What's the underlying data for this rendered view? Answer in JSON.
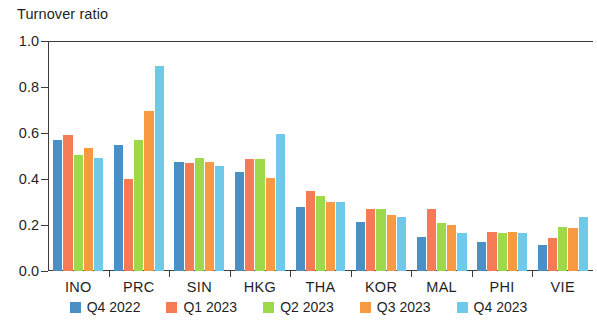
{
  "chart_data": {
    "type": "bar",
    "title": "Turnover ratio",
    "xlabel": "",
    "ylabel": "",
    "ylim": [
      0.0,
      1.0
    ],
    "ytick_labels": [
      "0.0",
      "0.2",
      "0.4",
      "0.6",
      "0.8",
      "1.0"
    ],
    "ytick_values": [
      0.0,
      0.2,
      0.4,
      0.6,
      0.8,
      1.0
    ],
    "grid": false,
    "legend_position": "bottom",
    "categories": [
      "INO",
      "PRC",
      "SIN",
      "HKG",
      "THA",
      "KOR",
      "MAL",
      "PHI",
      "VIE"
    ],
    "series": [
      {
        "name": "Q4 2022",
        "color": "#4a90c4",
        "values": [
          0.57,
          0.55,
          0.475,
          0.43,
          0.28,
          0.215,
          0.15,
          0.125,
          0.115
        ]
      },
      {
        "name": "Q1 2023",
        "color": "#f47b56",
        "values": [
          0.59,
          0.4,
          0.47,
          0.485,
          0.35,
          0.27,
          0.27,
          0.17,
          0.145
        ]
      },
      {
        "name": "Q2 2023",
        "color": "#9ed84b",
        "values": [
          0.505,
          0.57,
          0.49,
          0.485,
          0.325,
          0.27,
          0.21,
          0.165,
          0.19
        ]
      },
      {
        "name": "Q3 2023",
        "color": "#f89a41",
        "values": [
          0.535,
          0.695,
          0.475,
          0.405,
          0.3,
          0.245,
          0.2,
          0.17,
          0.185
        ]
      },
      {
        "name": "Q4 2023",
        "color": "#6fc9e8",
        "values": [
          0.49,
          0.89,
          0.455,
          0.595,
          0.3,
          0.235,
          0.165,
          0.165,
          0.235
        ]
      }
    ]
  },
  "legend": {
    "items": [
      {
        "label": "Q4 2022",
        "color": "#4a90c4"
      },
      {
        "label": "Q1 2023",
        "color": "#f47b56"
      },
      {
        "label": "Q2 2023",
        "color": "#9ed84b"
      },
      {
        "label": "Q3 2023",
        "color": "#f89a41"
      },
      {
        "label": "Q4 2023",
        "color": "#6fc9e8"
      }
    ]
  }
}
